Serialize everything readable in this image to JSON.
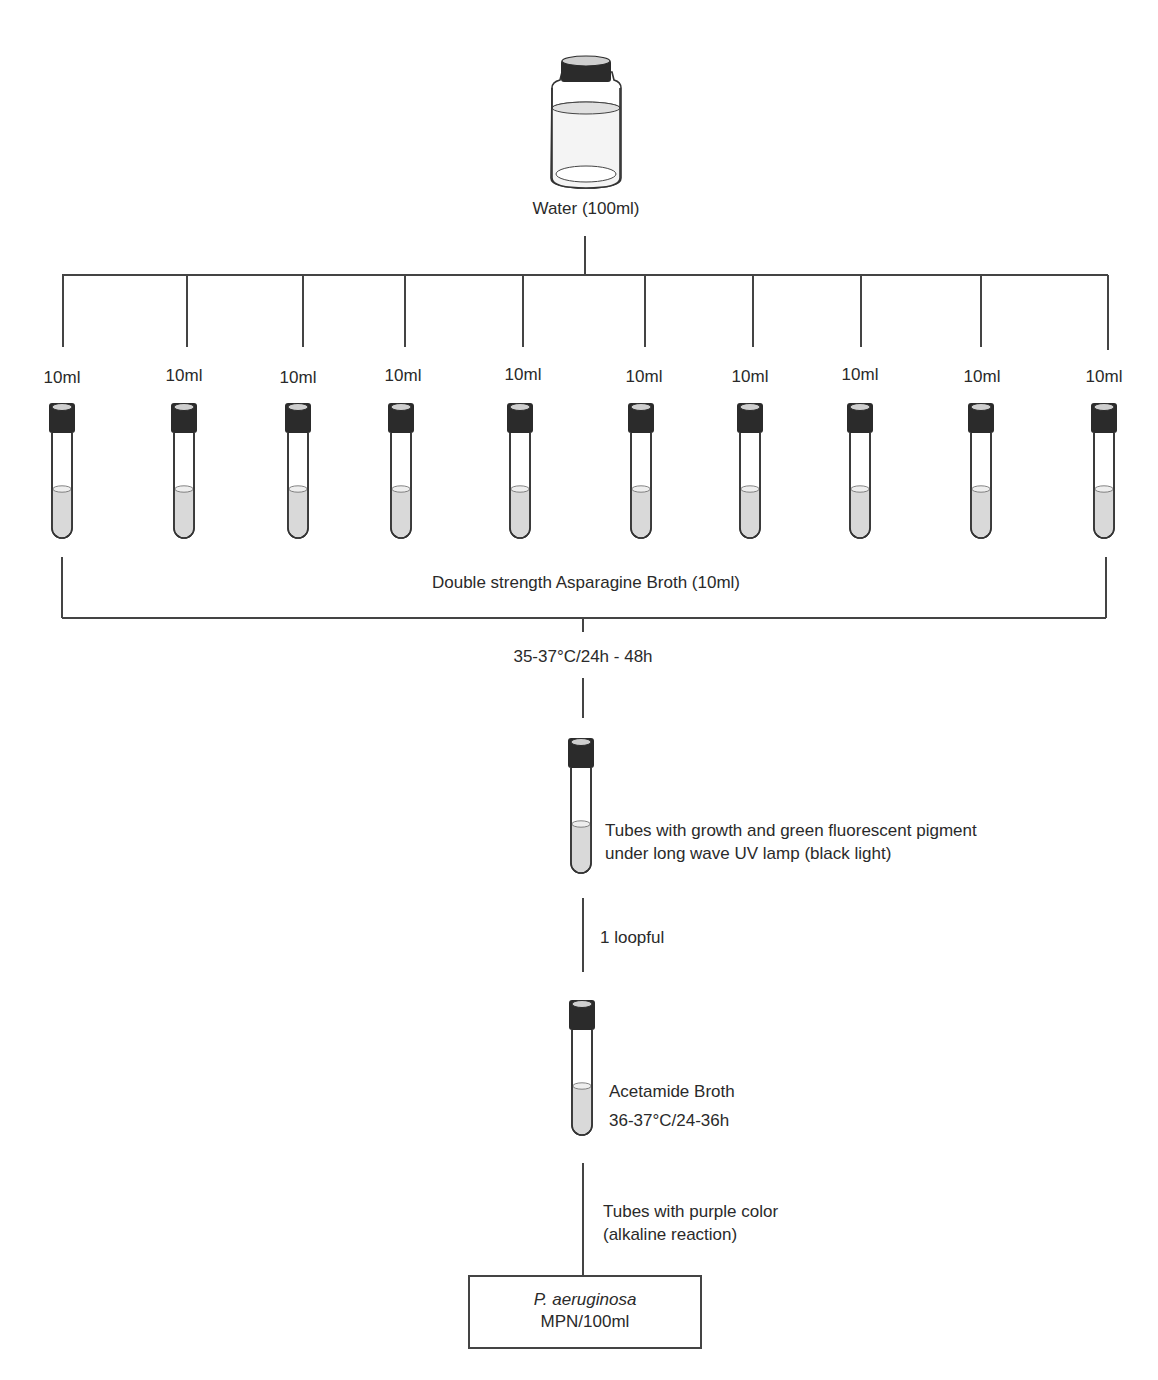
{
  "source": {
    "label": "Water (100ml)",
    "icon": "bottle-icon"
  },
  "aliquots": {
    "count": 10,
    "labels": [
      "10ml",
      "10ml",
      "10ml",
      "10ml",
      "10ml",
      "10ml",
      "10ml",
      "10ml",
      "10ml",
      "10ml"
    ],
    "icon": "test-tube-icon"
  },
  "presumptive": {
    "medium_label": "Double strength Asparagine Broth (10ml)",
    "incubation_label": "35-37°C/24h - 48h"
  },
  "positive_step": {
    "line1": "Tubes with growth and green fluorescent pigment",
    "line2": "under long wave UV lamp (black light)",
    "transfer_label": "1 loopful"
  },
  "confirmation": {
    "medium_label": "Acetamide Broth",
    "incubation_label": "36-37°C/24-36h",
    "positive_line1": "Tubes with purple color",
    "positive_line2": "(alkaline reaction)"
  },
  "result": {
    "species": "P. aeruginosa",
    "unit": "MPN/100ml"
  },
  "colors": {
    "line": "#444444",
    "cap": "#2b2b2b",
    "liquid": "#d9d9d9"
  }
}
